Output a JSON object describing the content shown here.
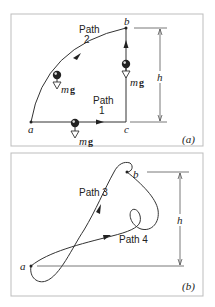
{
  "panel_a": {
    "label": "(a)",
    "points": {
      "a": "a",
      "b": "b",
      "c": "c"
    },
    "path1": {
      "line1": "Path",
      "line2": "1"
    },
    "path2": {
      "line1": "Path",
      "line2": "2"
    },
    "height_label": "h",
    "force_m": "m",
    "force_g": "g"
  },
  "panel_b": {
    "label": "(b)",
    "points": {
      "a": "a",
      "b": "b"
    },
    "path3": "Path 3",
    "path4": "Path 4",
    "height_label": "h"
  },
  "colors": {
    "line": "#333333",
    "frame": "#bdbdbd",
    "text": "#222222"
  }
}
